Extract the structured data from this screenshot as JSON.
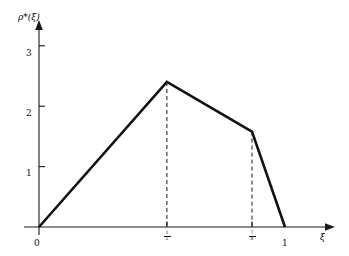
{
  "chart_data": {
    "type": "line",
    "title": "",
    "subtitle": "",
    "xlabel": "ξ",
    "ylabel": "ρ*(ξ)",
    "xlim": [
      0,
      1.18
    ],
    "ylim": [
      0,
      3.4
    ],
    "grid": false,
    "legend": null,
    "x_ticks": [
      {
        "value": 0,
        "label": "0",
        "kind": "plain"
      },
      {
        "value": 0.52,
        "label": "1/2",
        "kind": "fraction",
        "numerator": "1",
        "denominator": "2"
      },
      {
        "value": 0.866,
        "label": "7/8",
        "kind": "fraction",
        "numerator": "7",
        "denominator": "8"
      },
      {
        "value": 1,
        "label": "1",
        "kind": "plain"
      }
    ],
    "y_ticks": [
      {
        "value": 1,
        "label": "1"
      },
      {
        "value": 2,
        "label": "2"
      },
      {
        "value": 3,
        "label": "3"
      }
    ],
    "series": [
      {
        "name": "ρ*(ξ)",
        "style": "solid",
        "x": [
          0,
          0.52,
          0.866,
          1.0
        ],
        "y": [
          0,
          2.4,
          1.58,
          0
        ]
      }
    ],
    "annotations": [
      {
        "type": "vertical-dashed",
        "x": 0.52,
        "y_from": 0,
        "y_to": 2.4
      },
      {
        "type": "vertical-dashed",
        "x": 0.866,
        "y_from": 0,
        "y_to": 1.58
      }
    ],
    "axis_arrows": {
      "x": true,
      "y": true
    }
  },
  "labels": {
    "y_axis_title": "ρ*(ξ)",
    "x_axis_title": "ξ",
    "origin": "0",
    "x_one": "1",
    "y_one": "1",
    "y_two": "2",
    "y_three": "3",
    "frac1_num": "1",
    "frac1_den": "2",
    "frac2_num": "7",
    "frac2_den": "8"
  },
  "colors": {
    "curve": "#111111",
    "axis": "#1a1a1a",
    "dashed": "#1a1a1a",
    "background": "#ffffff"
  }
}
